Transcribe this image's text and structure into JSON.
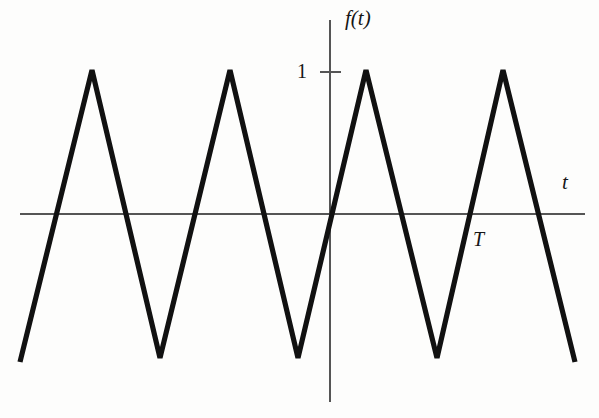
{
  "figure": {
    "title": "",
    "background_color": "#fdfdfc",
    "axis_color": "#555555",
    "curve_color": "#111111",
    "text_color": "#161616"
  },
  "labels": {
    "y_axis": "f(t)",
    "x_axis": "t",
    "period_marker": "T",
    "amplitude_tick": "1"
  },
  "chart_data": {
    "type": "line",
    "title": "",
    "subtitle": "",
    "xlabel": "t",
    "ylabel": "f(t)",
    "waveform": "triangle",
    "amplitude": 1,
    "period_label": "T",
    "period_pixels": 138,
    "grid": false,
    "legend": false,
    "legend_position": "none",
    "xlim": [
      -2.25,
      1.85
    ],
    "ylim": [
      -1.05,
      1.18
    ],
    "y_ticks": [
      1
    ],
    "y_tick_labels": [
      "1"
    ],
    "x_ticks": [],
    "x_tick_labels": [],
    "annotations": [
      {
        "text": "1",
        "x": -0.12,
        "y": 1.0,
        "role": "y-axis-tick-label"
      },
      {
        "text": "T",
        "x": 1.04,
        "y": -0.22,
        "role": "period-marker"
      },
      {
        "text": "f(t)",
        "x": 0.11,
        "y": 1.15,
        "role": "y-axis-name"
      },
      {
        "text": "t",
        "x": 1.72,
        "y": 0.18,
        "role": "x-axis-name"
      }
    ],
    "x": [
      -2.25,
      -1.75,
      -1.25,
      -0.75,
      -0.25,
      0.25,
      0.75,
      1.25,
      1.75
    ],
    "y": [
      -1,
      1,
      -1,
      1,
      -1,
      1,
      -1,
      1,
      -1
    ],
    "peaks_t": [
      -1.75,
      -0.75,
      0.25,
      1.25
    ],
    "valleys_t": [
      -2.25,
      -1.25,
      -0.25,
      0.75,
      1.75
    ],
    "zero_crossings_t": [
      -2.0,
      -1.5,
      -1.0,
      -0.5,
      0.0,
      0.5,
      1.0,
      1.5
    ],
    "series": [
      {
        "name": "f(t)",
        "values": [
          -1,
          1,
          -1,
          1,
          -1,
          1,
          -1,
          1,
          -1
        ]
      }
    ]
  },
  "geometry": {
    "origin_px": [
      330,
      214
    ],
    "y_axis_px": {
      "x": 330,
      "y_top": 20,
      "y_bottom": 402
    },
    "x_axis_px": {
      "y": 214,
      "x_left": 20,
      "x_right": 585
    },
    "amplitude_tick_px": {
      "y": 72,
      "x_from": 320,
      "x_to": 341
    },
    "curve_points_px": [
      [
        20,
        362
      ],
      [
        92,
        70
      ],
      [
        160,
        358
      ],
      [
        230,
        70
      ],
      [
        298,
        358
      ],
      [
        366,
        70
      ],
      [
        437,
        358
      ],
      [
        503,
        70
      ],
      [
        575,
        362
      ]
    ],
    "curve_stroke_width_px": 5.2,
    "axis_stroke_width_px": 1.2
  }
}
